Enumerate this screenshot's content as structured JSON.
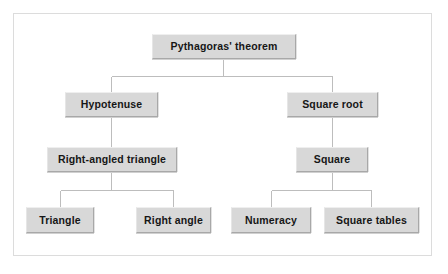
{
  "diagram": {
    "type": "tree",
    "title_node": "Pythagoras' theorem",
    "background_color": "#ffffff",
    "frame_color": "#dcdcdc",
    "node_fill_color": "#d8d8d8",
    "node_border_color": "#a8a8a8",
    "node_text_color": "#161616",
    "edge_color": "#bdbdbd",
    "nodes": [
      {
        "id": "root",
        "label": "Pythagoras' theorem",
        "level": 0,
        "x": 152,
        "y": 34,
        "w": 144,
        "h": 25
      },
      {
        "id": "hyp",
        "label": "Hypotenuse",
        "level": 1,
        "x": 65,
        "y": 92,
        "w": 93,
        "h": 25
      },
      {
        "id": "sqroot",
        "label": "Square root",
        "level": 1,
        "x": 287,
        "y": 92,
        "w": 91,
        "h": 25
      },
      {
        "id": "rat",
        "label": "Right-angled triangle",
        "level": 2,
        "x": 47,
        "y": 147,
        "w": 130,
        "h": 25
      },
      {
        "id": "square",
        "label": "Square",
        "level": 2,
        "x": 296,
        "y": 147,
        "w": 72,
        "h": 25
      },
      {
        "id": "triangle",
        "label": "Triangle",
        "level": 3,
        "x": 26,
        "y": 207,
        "w": 68,
        "h": 26
      },
      {
        "id": "rightang",
        "label": "Right angle",
        "level": 3,
        "x": 136,
        "y": 207,
        "w": 75,
        "h": 26
      },
      {
        "id": "numeracy",
        "label": "Numeracy",
        "level": 3,
        "x": 231,
        "y": 207,
        "w": 80,
        "h": 26
      },
      {
        "id": "sqtables",
        "label": "Square tables",
        "level": 3,
        "x": 324,
        "y": 207,
        "w": 95,
        "h": 26
      }
    ],
    "edges": [
      {
        "from": "root",
        "to": "hyp"
      },
      {
        "from": "root",
        "to": "sqroot"
      },
      {
        "from": "hyp",
        "to": "rat"
      },
      {
        "from": "sqroot",
        "to": "square"
      },
      {
        "from": "rat",
        "to": "triangle"
      },
      {
        "from": "rat",
        "to": "rightang"
      },
      {
        "from": "square",
        "to": "numeracy"
      },
      {
        "from": "square",
        "to": "sqtables"
      }
    ]
  }
}
